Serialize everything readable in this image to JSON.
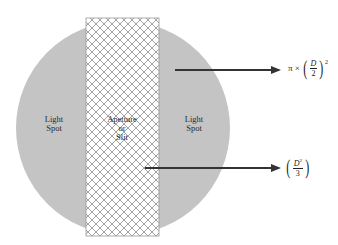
{
  "diagram": {
    "type": "aperture-light-spot",
    "colors": {
      "light_spot_fill": "#c4c4c4",
      "hatch_line": "#8a8a8a",
      "aperture_border": "#9a9a9a",
      "arrow": "#333333",
      "background": "#ffffff"
    },
    "labels": {
      "left_spot_line1": "Light",
      "left_spot_line2": "Spot",
      "right_spot_line1": "Light",
      "right_spot_line2": "Spot",
      "aperture_line1": "Apetture",
      "aperture_line2": "or",
      "aperture_line3": "Slit"
    },
    "formulas": {
      "spot_area": {
        "prefix": "π ×",
        "numerator": "D",
        "denominator": "2",
        "exponent": "2"
      },
      "slit_area": {
        "numerator": "D",
        "numerator_exponent": "2",
        "denominator": "3"
      }
    }
  }
}
